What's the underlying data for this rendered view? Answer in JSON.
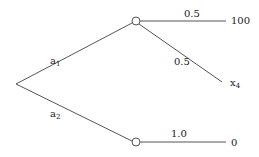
{
  "diagram": {
    "type": "decision-tree",
    "root": {
      "x": 16,
      "y": 84
    },
    "branches": [
      {
        "id": "a1",
        "label": "a",
        "label_sub": "1",
        "to_node": "chance-top"
      },
      {
        "id": "a2",
        "label": "a",
        "label_sub": "2",
        "to_node": "chance-bottom"
      }
    ],
    "chance_nodes": [
      {
        "id": "chance-top",
        "x": 136,
        "y": 21,
        "outcomes": [
          {
            "probability": "0.5",
            "payoff": "100"
          },
          {
            "probability": "0.5",
            "payoff": "x",
            "payoff_sub": "4"
          }
        ]
      },
      {
        "id": "chance-bottom",
        "x": 136,
        "y": 142,
        "outcomes": [
          {
            "probability": "1.0",
            "payoff": "0"
          }
        ]
      }
    ],
    "colors": {
      "line": "#555555",
      "text": "#222222",
      "background": "#ffffff"
    }
  }
}
